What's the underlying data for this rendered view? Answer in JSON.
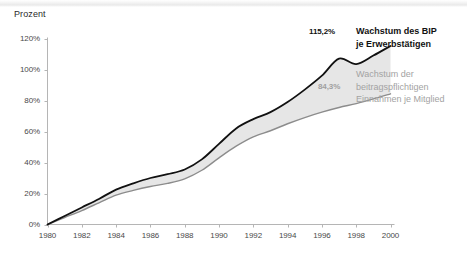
{
  "axis_title": "Prozent",
  "labels": {
    "top_value": "115,2%",
    "bottom_value": "84,3%",
    "legend_top_line1": "Wachstum des BIP",
    "legend_top_line2": "je Erwerbstätigen",
    "legend_bottom_line1": "Wachstum der",
    "legend_bottom_line2": "beitragspflichtigen",
    "legend_bottom_line3": "Einnahmen je Mitglied"
  },
  "colors": {
    "series_top_line": "#111111",
    "series_bottom_line": "#8c8c8c",
    "band_fill": "#e6e6e6",
    "axis": "#b5b5b5",
    "tick_text": "#4a4a4a",
    "legend_bottom_text": "#a3a3a3",
    "top_band": "#ececec"
  },
  "chart_data": {
    "type": "area",
    "title": "",
    "subtitle": "",
    "xlabel": "",
    "ylabel": "Prozent",
    "xlim": [
      1980,
      2000
    ],
    "ylim": [
      0,
      120
    ],
    "ytick_labels": [
      "0%",
      "20%",
      "40%",
      "60%",
      "80%",
      "100%",
      "120%"
    ],
    "yticks": [
      0,
      20,
      40,
      60,
      80,
      100,
      120
    ],
    "xticks": [
      1980,
      1982,
      1984,
      1986,
      1988,
      1990,
      1992,
      1994,
      1996,
      1998,
      2000
    ],
    "xtick_labels": [
      "1980",
      "1982",
      "1984",
      "1986",
      "1988",
      "1990",
      "1992",
      "1994",
      "1996",
      "1998",
      "2000"
    ],
    "grid": false,
    "legend_position": "right",
    "x": [
      1980,
      1981,
      1982,
      1983,
      1984,
      1985,
      1986,
      1987,
      1988,
      1989,
      1990,
      1991,
      1992,
      1993,
      1994,
      1995,
      1996,
      1997,
      1998,
      1999,
      2000
    ],
    "series": [
      {
        "name": "Wachstum des BIP je Erwerbstätigen",
        "color": "#111111",
        "end_label": "115,2%",
        "values": [
          0,
          5.5,
          11.0,
          16.5,
          22.5,
          26.5,
          30.0,
          32.5,
          35.5,
          42.0,
          52.0,
          62.0,
          68.0,
          72.5,
          79.0,
          87.0,
          96.0,
          107.0,
          103.5,
          109.0,
          115.2
        ]
      },
      {
        "name": "Wachstum der beitragspflichtigen Einnahmen je Mitglied",
        "color": "#8c8c8c",
        "end_label": "84,3%",
        "values": [
          0,
          4.5,
          9.0,
          14.0,
          19.0,
          22.0,
          24.5,
          26.5,
          29.5,
          35.0,
          43.0,
          50.5,
          56.5,
          60.5,
          65.0,
          69.0,
          72.5,
          75.5,
          78.0,
          81.0,
          84.3
        ]
      }
    ]
  }
}
